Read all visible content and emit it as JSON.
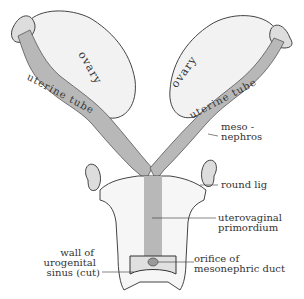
{
  "labels": {
    "ovary_left": "ovary",
    "ovary_right": "ovary",
    "uterine_tube_left": "uterine tube",
    "uterine_tube_right": "uterine tube",
    "mesonephros_1": "meso -",
    "mesonephros_2": "nephros",
    "round_lig": "round lig",
    "uterovaginal_1": "uterovaginal",
    "uterovaginal_2": "primordium",
    "orifice_1": "orifice of",
    "orifice_2": "mesonephric duct",
    "wall_1": "wall of",
    "wall_2": "urogenital",
    "wall_3": "sinus (cut)"
  },
  "colors": {
    "tube_fill": "#b8b8b8",
    "outline": "#333333",
    "ovary_fill": "#f4f4f4"
  }
}
